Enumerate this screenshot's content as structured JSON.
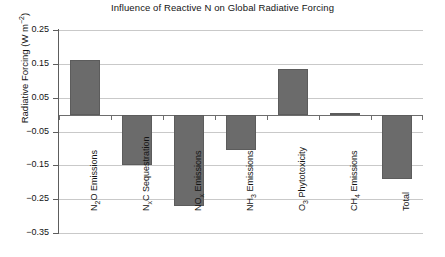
{
  "chart_data": {
    "type": "bar",
    "title": "Influence of Reactive N on Global Radiative Forcing",
    "xlabel": "",
    "ylabel": "Radiative Forcing (W m⁻²)",
    "ylabel_parts": {
      "text": "Radiative Forcing (W m",
      "sup": "−2",
      "tail": ")"
    },
    "categories": [
      "N2O Emissions",
      "NxC Sequestration",
      "NOx Emissions",
      "NH3 Emissions",
      "O3 Phytotoxicity",
      "CH4 Emissions",
      "Total"
    ],
    "category_labels_rich": [
      {
        "pre": "N",
        "sub": "2",
        "post": "O Emissions"
      },
      {
        "pre": "N",
        "sub": "x",
        "post": "C Sequestration"
      },
      {
        "pre": "NO",
        "sub": "x",
        "post": " Emissions"
      },
      {
        "pre": "NH",
        "sub": "3",
        "post": " Emissions"
      },
      {
        "pre": "O",
        "sub": "3",
        "post": " Phytotoxicity"
      },
      {
        "pre": "CH",
        "sub": "4",
        "post": " Emissions"
      },
      {
        "pre": "Total",
        "sub": "",
        "post": ""
      }
    ],
    "values": [
      0.16,
      -0.15,
      -0.27,
      -0.105,
      0.135,
      0.005,
      -0.19
    ],
    "ylim": [
      -0.35,
      0.25
    ],
    "yticks": [
      0.25,
      0.15,
      0.05,
      -0.05,
      -0.15,
      -0.25,
      -0.35
    ],
    "ytick_labels": [
      "0.25",
      "0.15",
      "0.05",
      "−0.05",
      "−0.15",
      "−0.25",
      "−0.35"
    ],
    "grid": true,
    "legend": "none",
    "bar_color": "#6b6b6b",
    "grid_color": "#c9c9c9",
    "axis_color": "#5d5d5d"
  }
}
